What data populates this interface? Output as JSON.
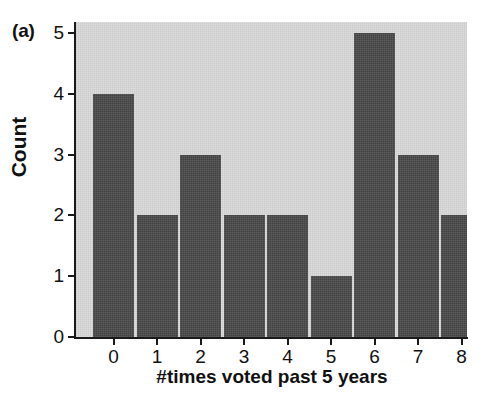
{
  "chart_data": {
    "type": "bar",
    "title": "",
    "panel_label": "(a)",
    "xlabel": "#times voted past 5 years",
    "ylabel": "Count",
    "categories": [
      "0",
      "1",
      "2",
      "3",
      "4",
      "5",
      "6",
      "7",
      "8"
    ],
    "values": [
      4,
      2,
      3,
      2,
      2,
      1,
      5,
      3,
      2
    ],
    "xtick_labels": [
      "0",
      "1",
      "2",
      "3",
      "4",
      "5",
      "6",
      "7",
      "8"
    ],
    "ytick_labels": [
      "0",
      "1",
      "2",
      "3",
      "4",
      "5"
    ],
    "ytick_values": [
      0,
      1,
      2,
      3,
      4,
      5
    ],
    "ylim": [
      0,
      5.18
    ],
    "grid": false,
    "legend": null,
    "legend_position": "none",
    "colors": {
      "bar": "#4a4a4a",
      "plot_background": "#d2d2d2",
      "figure_background": "#ffffff",
      "axis": "#1a1a1a",
      "text": "#111111"
    }
  }
}
